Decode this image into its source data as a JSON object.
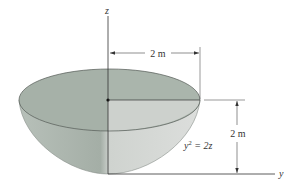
{
  "figure": {
    "axes": {
      "z_label": "z",
      "y_label": "y"
    },
    "dimensions": {
      "radius_label": "2 m",
      "height_label": "2 m"
    },
    "equation": {
      "base": "y",
      "exponent": "2",
      "rest": " = 2z"
    },
    "colors": {
      "rim_top": "#a9b5ab",
      "shell_dark": "#9fa9a1",
      "shell_light": "#d6d9d6",
      "lines": "#333333"
    }
  }
}
